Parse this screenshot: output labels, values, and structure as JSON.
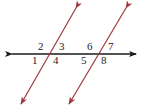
{
  "diagram": {
    "colors": {
      "horizontal_line": "#1a1a1a",
      "transversal": "#a0393f",
      "label": "#222222",
      "background": "#ffffff"
    },
    "lines": {
      "horizontal": {
        "x1": 12,
        "y1": 54,
        "x2": 136,
        "y2": 54
      },
      "transversal_left": {
        "x1": 76,
        "y1": 8,
        "x2": 21,
        "y2": 104
      },
      "transversal_right": {
        "x1": 126,
        "y1": 8,
        "x2": 69,
        "y2": 104
      }
    },
    "angle_labels": [
      {
        "id": "1",
        "text": "1",
        "x": 32,
        "y": 64
      },
      {
        "id": "2",
        "text": "2",
        "x": 38,
        "y": 50
      },
      {
        "id": "3",
        "text": "3",
        "x": 59,
        "y": 50
      },
      {
        "id": "4",
        "text": "4",
        "x": 53,
        "y": 64
      },
      {
        "id": "5",
        "text": "5",
        "x": 81,
        "y": 64
      },
      {
        "id": "6",
        "text": "6",
        "x": 87,
        "y": 50
      },
      {
        "id": "7",
        "text": "7",
        "x": 108,
        "y": 50
      },
      {
        "id": "8",
        "text": "8",
        "x": 101,
        "y": 64
      }
    ]
  }
}
